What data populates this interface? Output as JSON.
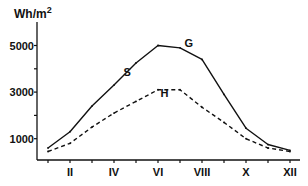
{
  "chart_data": {
    "type": "line",
    "title": "",
    "ylabel": "Wh/m²",
    "ylabel_main": "Wh/m",
    "ylabel_sup": "2",
    "xlabel": "",
    "ylim": [
      0,
      5900
    ],
    "yticks": [
      1000,
      2000,
      3000,
      4000,
      5000
    ],
    "ytick_labels": [
      {
        "value": 1000,
        "label": "1000"
      },
      {
        "value": 3000,
        "label": "3000"
      },
      {
        "value": 5000,
        "label": "5000"
      }
    ],
    "x": [
      1,
      2,
      3,
      4,
      5,
      6,
      7,
      8,
      9,
      10,
      11,
      12
    ],
    "xticks": [
      1,
      2,
      3,
      4,
      5,
      6,
      7,
      8,
      9,
      10,
      11,
      12
    ],
    "xtick_labels": [
      {
        "value": 2,
        "label": "II"
      },
      {
        "value": 4,
        "label": "IV"
      },
      {
        "value": 6,
        "label": "VI"
      },
      {
        "value": 8,
        "label": "VIII"
      },
      {
        "value": 10,
        "label": "X"
      },
      {
        "value": 12,
        "label": "XII"
      }
    ],
    "series": [
      {
        "name": "G",
        "style": "solid",
        "values": [
          600,
          1300,
          2400,
          3300,
          4250,
          5000,
          4900,
          4400,
          2900,
          1450,
          750,
          500
        ]
      },
      {
        "name": "H",
        "style": "dashed",
        "values": [
          450,
          800,
          1500,
          2100,
          2600,
          3100,
          3100,
          2350,
          1700,
          1000,
          600,
          450
        ]
      }
    ],
    "annotations": [
      {
        "text": "G",
        "x": 7.4,
        "y": 4950
      },
      {
        "text": "S",
        "x": 4.6,
        "y": 3700
      },
      {
        "text": "H",
        "x": 6.3,
        "y": 2800
      }
    ],
    "grid": false,
    "legend": "none"
  }
}
